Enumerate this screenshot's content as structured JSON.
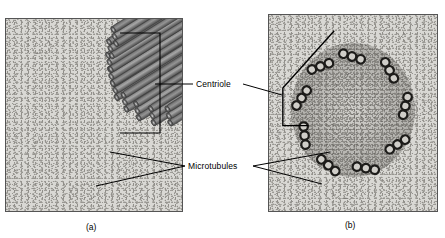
{
  "figure": {
    "type": "biology-diagram",
    "panels": [
      {
        "id": "a",
        "caption": "(a)",
        "kind": "illustration",
        "description": "Three-dimensional drawing of a centriole: a cylindrical barrel built from nine triplets of microtubules arranged in a ring, shown at an oblique angle with open tubule ends facing lower-left.",
        "triplet_count": 9,
        "tubules_per_triplet": 3,
        "background": "cytoplasm",
        "bracket": "rectangular bracket outlining the centriole on the right side"
      },
      {
        "id": "b",
        "caption": "(b)",
        "kind": "electron-micrograph",
        "description": "Transmission electron micrograph of a centriole in cross section showing nine microtubule triplets in a pinwheel arrangement.",
        "triplet_count": 9,
        "tubules_per_triplet": 3,
        "background": "cytoplasm",
        "bracket": "angled bracket outlining the centriole on the upper-left"
      }
    ],
    "labels": [
      {
        "id": "centriole",
        "text": "Centriole",
        "leaders": 2
      },
      {
        "id": "microtubules",
        "text": "Microtubules",
        "leaders": 4
      }
    ],
    "colors": {
      "tubule_dark": "#5f5f5f",
      "tubule_mid": "#7c7c7c",
      "tubule_light": "#a2a2a2",
      "cytoplasm": "#d9d8d4",
      "line": "#000000",
      "panel_border": "#555555"
    }
  }
}
